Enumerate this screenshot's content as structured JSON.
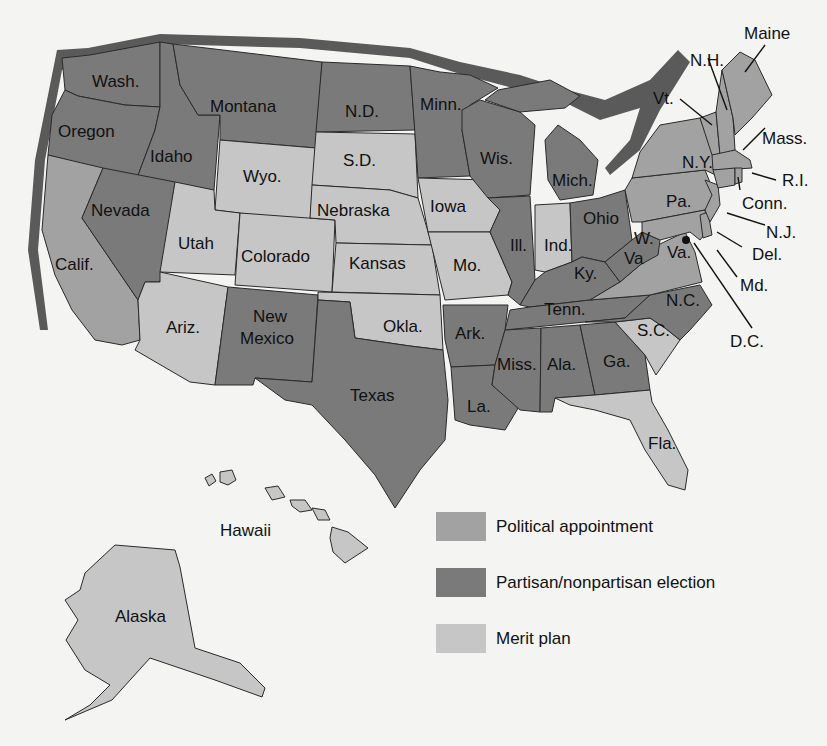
{
  "colors": {
    "background": "#f4f4f2",
    "political_appointment": "#a2a2a2",
    "election": "#7a7a7a",
    "merit_plan": "#c6c6c6",
    "shadow": "#555555"
  },
  "legend": [
    {
      "label": "Political appointment",
      "category": "political_appointment"
    },
    {
      "label": "Partisan/nonpartisan election",
      "category": "election"
    },
    {
      "label": "Merit plan",
      "category": "merit_plan"
    }
  ],
  "states": {
    "wash": {
      "label": "Wash.",
      "category": "election"
    },
    "oregon": {
      "label": "Oregon",
      "category": "election"
    },
    "idaho": {
      "label": "Idaho",
      "category": "election"
    },
    "montana": {
      "label": "Montana",
      "category": "election"
    },
    "nd": {
      "label": "N.D.",
      "category": "election"
    },
    "minn": {
      "label": "Minn.",
      "category": "election"
    },
    "wis": {
      "label": "Wis.",
      "category": "election"
    },
    "mich": {
      "label": "Mich.",
      "category": "election"
    },
    "calif": {
      "label": "Calif.",
      "category": "political_appointment"
    },
    "nevada": {
      "label": "Nevada",
      "category": "election"
    },
    "utah": {
      "label": "Utah",
      "category": "merit_plan"
    },
    "ariz": {
      "label": "Ariz.",
      "category": "merit_plan"
    },
    "wyo": {
      "label": "Wyo.",
      "category": "merit_plan"
    },
    "colorado": {
      "label": "Colorado",
      "category": "merit_plan"
    },
    "nm": {
      "label": "New Mexico",
      "category": "election"
    },
    "sd": {
      "label": "S.D.",
      "category": "merit_plan"
    },
    "nebraska": {
      "label": "Nebraska",
      "category": "merit_plan"
    },
    "kansas": {
      "label": "Kansas",
      "category": "merit_plan"
    },
    "okla": {
      "label": "Okla.",
      "category": "merit_plan"
    },
    "texas": {
      "label": "Texas",
      "category": "election"
    },
    "iowa": {
      "label": "Iowa",
      "category": "merit_plan"
    },
    "mo": {
      "label": "Mo.",
      "category": "merit_plan"
    },
    "ark": {
      "label": "Ark.",
      "category": "election"
    },
    "la": {
      "label": "La.",
      "category": "election"
    },
    "ill": {
      "label": "Ill.",
      "category": "election"
    },
    "ind": {
      "label": "Ind.",
      "category": "merit_plan"
    },
    "ohio": {
      "label": "Ohio",
      "category": "election"
    },
    "ky": {
      "label": "Ky.",
      "category": "election"
    },
    "tenn": {
      "label": "Tenn.",
      "category": "election"
    },
    "miss": {
      "label": "Miss.",
      "category": "election"
    },
    "ala": {
      "label": "Ala.",
      "category": "election"
    },
    "ga": {
      "label": "Ga.",
      "category": "election"
    },
    "fla": {
      "label": "Fla.",
      "category": "merit_plan"
    },
    "sc": {
      "label": "S.C.",
      "category": "merit_plan"
    },
    "nc": {
      "label": "N.C.",
      "category": "election"
    },
    "va": {
      "label": "Va.",
      "category": "political_appointment"
    },
    "wva": {
      "label": "W. Va",
      "category": "election"
    },
    "md": {
      "label": "Md.",
      "category": "political_appointment"
    },
    "del": {
      "label": "Del.",
      "category": "political_appointment"
    },
    "nj": {
      "label": "N.J.",
      "category": "political_appointment"
    },
    "pa": {
      "label": "Pa.",
      "category": "political_appointment"
    },
    "ny": {
      "label": "N.Y.",
      "category": "political_appointment"
    },
    "conn": {
      "label": "Conn.",
      "category": "political_appointment"
    },
    "ri": {
      "label": "R.I.",
      "category": "political_appointment"
    },
    "mass": {
      "label": "Mass.",
      "category": "political_appointment"
    },
    "vt": {
      "label": "Vt.",
      "category": "political_appointment"
    },
    "nh": {
      "label": "N.H.",
      "category": "political_appointment"
    },
    "maine": {
      "label": "Maine",
      "category": "political_appointment"
    },
    "dc": {
      "label": "D.C.",
      "category": "political_appointment"
    },
    "alaska": {
      "label": "Alaska",
      "category": "merit_plan"
    },
    "hawaii": {
      "label": "Hawaii",
      "category": "merit_plan"
    }
  },
  "labels": {
    "wash": "Wash.",
    "oregon": "Oregon",
    "idaho": "Idaho",
    "montana": "Montana",
    "nd": "N.D.",
    "minn": "Minn.",
    "wis": "Wis.",
    "mich": "Mich.",
    "calif": "Calif.",
    "nevada": "Nevada",
    "utah": "Utah",
    "ariz": "Ariz.",
    "wyo": "Wyo.",
    "colorado": "Colorado",
    "nm1": "New",
    "nm2": "Mexico",
    "sd": "S.D.",
    "nebraska": "Nebraska",
    "kansas": "Kansas",
    "okla": "Okla.",
    "texas": "Texas",
    "iowa": "Iowa",
    "mo": "Mo.",
    "ark": "Ark.",
    "la": "La.",
    "ill": "Ill.",
    "ind": "Ind.",
    "ohio": "Ohio",
    "ky": "Ky.",
    "tenn": "Tenn.",
    "miss": "Miss.",
    "ala": "Ala.",
    "ga": "Ga.",
    "fla": "Fla.",
    "sc": "S.C.",
    "nc": "N.C.",
    "va": "Va.",
    "wva1": "W.",
    "wva2": "Va",
    "md": "Md.",
    "del": "Del.",
    "nj": "N.J.",
    "pa": "Pa.",
    "ny": "N.Y.",
    "conn": "Conn.",
    "ri": "R.I.",
    "mass": "Mass.",
    "vt": "Vt.",
    "nh": "N.H.",
    "maine": "Maine",
    "dc": "D.C.",
    "alaska": "Alaska",
    "hawaii": "Hawaii"
  }
}
